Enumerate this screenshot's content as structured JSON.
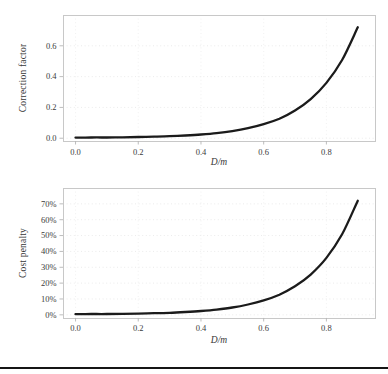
{
  "page": {
    "background": "#ffffff",
    "footer_rule_color": "#151515"
  },
  "style": {
    "curve_color": "#1b1b1b",
    "curve_width": 2.3,
    "spine_color": "#c8c8c8",
    "tick_color": "#b5b5b5",
    "grid_color_h": "#e9e9e9",
    "grid_color_v": "#efefef",
    "text_color": "#3b3b3b"
  },
  "chart_data": [
    {
      "type": "line",
      "title": "",
      "xlabel": "D/m",
      "ylabel": "Correction factor",
      "legend": "none",
      "grid": "dotted",
      "xlim": [
        -0.04,
        0.955
      ],
      "ylim": [
        -0.018,
        0.8
      ],
      "xticks": {
        "values": [
          0.0,
          0.2,
          0.4,
          0.6,
          0.8
        ],
        "labels": [
          "0.0",
          "0.2",
          "0.4",
          "0.6",
          "0.8"
        ]
      },
      "yticks": {
        "values": [
          0.0,
          0.2,
          0.4,
          0.6
        ],
        "labels": [
          "0.0",
          "0.2",
          "0.4",
          "0.6"
        ]
      },
      "series": [
        {
          "name": "correction-factor-curve",
          "x": [
            0.0,
            0.05,
            0.1,
            0.15,
            0.2,
            0.25,
            0.3,
            0.35,
            0.4,
            0.45,
            0.5,
            0.55,
            0.6,
            0.65,
            0.7,
            0.75,
            0.8,
            0.85,
            0.9
          ],
          "y": [
            0.004,
            0.005,
            0.005,
            0.006,
            0.008,
            0.01,
            0.013,
            0.018,
            0.024,
            0.033,
            0.046,
            0.065,
            0.091,
            0.127,
            0.18,
            0.254,
            0.359,
            0.508,
            0.72
          ]
        }
      ]
    },
    {
      "type": "line",
      "title": "",
      "xlabel": "D/m",
      "ylabel": "Cost penalty",
      "legend": "none",
      "grid": "dotted",
      "xlim": [
        -0.04,
        0.955
      ],
      "ylim": [
        -2.0,
        80
      ],
      "xticks": {
        "values": [
          0.0,
          0.2,
          0.4,
          0.6,
          0.8
        ],
        "labels": [
          "0.0",
          "0.2",
          "0.4",
          "0.6",
          "0.8"
        ]
      },
      "yticks": {
        "values": [
          0,
          10,
          20,
          30,
          40,
          50,
          60,
          70
        ],
        "labels": [
          "0%",
          "10%",
          "20%",
          "30%",
          "40%",
          "50%",
          "60%",
          "70%"
        ]
      },
      "series": [
        {
          "name": "cost-penalty-curve",
          "x": [
            0.0,
            0.05,
            0.1,
            0.15,
            0.2,
            0.25,
            0.3,
            0.35,
            0.4,
            0.45,
            0.5,
            0.55,
            0.6,
            0.65,
            0.7,
            0.75,
            0.8,
            0.85,
            0.9
          ],
          "y": [
            0.4,
            0.5,
            0.5,
            0.6,
            0.8,
            1.0,
            1.3,
            1.8,
            2.4,
            3.3,
            4.6,
            6.5,
            9.1,
            12.7,
            18.0,
            25.4,
            35.9,
            50.8,
            72.0
          ]
        }
      ]
    }
  ]
}
